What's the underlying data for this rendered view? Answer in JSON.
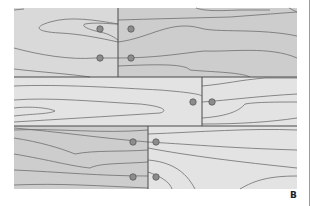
{
  "figure": {
    "panel_label": "B",
    "colors": {
      "board_light": "#e3e3e3",
      "board_medium": "#d9d9d9",
      "board_dark": "#cdcdcd",
      "grain_line": "#6e6e6e",
      "seam_line": "#4a4a4a",
      "dowel_fill": "#8c8c8c",
      "dowel_stroke": "#5a5a5a",
      "right_rule": "#9a9a9a"
    },
    "rows": [
      {
        "name": "row-1",
        "boards": [
          {
            "x": 14,
            "y": 8,
            "w": 104,
            "h": 69,
            "shade": "board_medium"
          },
          {
            "x": 118,
            "y": 8,
            "w": 179,
            "h": 69,
            "shade": "board_dark"
          }
        ],
        "dowels": [
          [
            100,
            29
          ],
          [
            100,
            58
          ],
          [
            131,
            29
          ],
          [
            131,
            58
          ]
        ]
      },
      {
        "name": "row-2",
        "boards": [
          {
            "x": 14,
            "y": 77,
            "w": 188,
            "h": 49,
            "shade": "board_light"
          },
          {
            "x": 202,
            "y": 77,
            "w": 95,
            "h": 49,
            "shade": "board_light"
          }
        ],
        "dowels": [
          [
            193,
            102
          ],
          [
            212,
            102
          ]
        ]
      },
      {
        "name": "row-3",
        "boards": [
          {
            "x": 14,
            "y": 126,
            "w": 134,
            "h": 63,
            "shade": "board_dark"
          },
          {
            "x": 148,
            "y": 126,
            "w": 149,
            "h": 63,
            "shade": "board_light"
          }
        ],
        "dowels": [
          [
            133,
            142
          ],
          [
            133,
            177
          ],
          [
            156,
            142
          ],
          [
            156,
            177
          ]
        ]
      }
    ]
  }
}
